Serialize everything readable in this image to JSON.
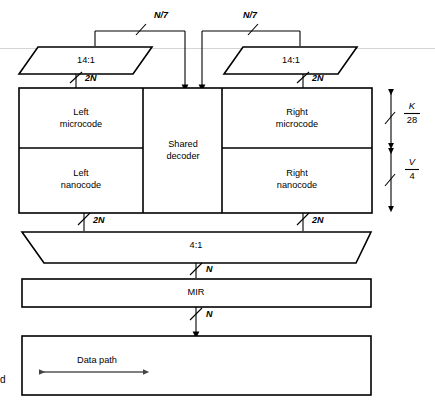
{
  "figure": {
    "background_color": "#ffffff",
    "line_color": "#000000"
  },
  "mux_top_left": {
    "label": "14:1",
    "input_label": "N/7",
    "output_label": "2N"
  },
  "mux_top_right": {
    "label": "14:1",
    "input_label": "N/7",
    "output_label": "2N"
  },
  "store": {
    "left_micro": "Left\nmicrocode",
    "left_micro_line1": "Left",
    "left_micro_line2": "microcode",
    "left_nano_line1": "Left",
    "left_nano_line2": "nanocode",
    "shared_line1": "Shared",
    "shared_line2": "decoder",
    "right_micro_line1": "Right",
    "right_micro_line2": "microcode",
    "right_nano_line1": "Right",
    "right_nano_line2": "nanocode",
    "out_left_label": "2N",
    "out_right_label": "2N"
  },
  "dimensions": {
    "micro_height_num": "K",
    "micro_height_den": "28",
    "nano_height_num": "V",
    "nano_height_den": "4"
  },
  "mux_bottom": {
    "label": "4:1",
    "output_label": "N"
  },
  "mir": {
    "label": "MIR",
    "output_label": "N"
  },
  "datapath": {
    "label": "Data path"
  },
  "stray_mark": {
    "text": "d"
  },
  "icons": {
    "bus_slash": "bus-slash-tick-icon",
    "arrow_down": "arrow-down-icon",
    "arrow_double_vertical": "double-headed-vertical-arrow-icon",
    "arrow_double_horizontal": "double-headed-horizontal-arrow-icon"
  }
}
